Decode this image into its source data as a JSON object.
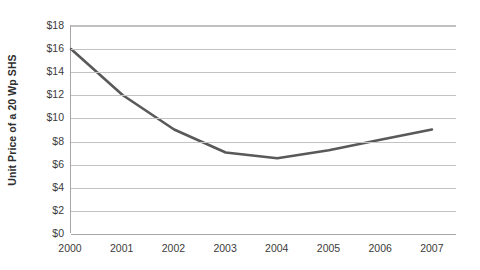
{
  "chart_data": {
    "type": "line",
    "title": "",
    "xlabel": "",
    "ylabel": "Unit Price of a 20 Wp SHS",
    "categories": [
      "2000",
      "2001",
      "2002",
      "2003",
      "2004",
      "2005",
      "2006",
      "2007"
    ],
    "values": [
      16.0,
      12.0,
      9.0,
      7.0,
      6.5,
      7.2,
      8.1,
      9.0
    ],
    "series": [
      {
        "name": "Unit Price of a 20 Wp SHS",
        "values": [
          16.0,
          12.0,
          9.0,
          7.0,
          6.5,
          7.2,
          8.1,
          9.0
        ],
        "color": "#595959"
      }
    ],
    "ylim": [
      0,
      18
    ],
    "ytick_values": [
      0,
      2,
      4,
      6,
      8,
      10,
      12,
      14,
      16,
      18
    ],
    "ytick_labels": [
      "$0",
      "$2",
      "$4",
      "$6",
      "$8",
      "$10",
      "$12",
      "$14",
      "$16",
      "$18"
    ],
    "xtick_labels": [
      "2000",
      "2001",
      "2002",
      "2003",
      "2004",
      "2005",
      "2006",
      "2007"
    ],
    "grid": true,
    "grid_axis": "y",
    "legend": false,
    "legend_position": "none",
    "colors": {
      "line": "#595959",
      "gridline": "#c3c3c3",
      "axis": "#a6a6a6",
      "text": "#3b3b3b",
      "background": "#ffffff"
    }
  }
}
